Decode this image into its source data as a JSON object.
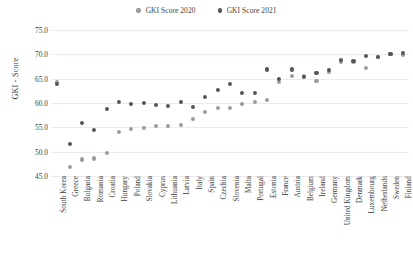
{
  "chart_data": {
    "type": "scatter",
    "title": "",
    "xlabel": "",
    "ylabel": "GKI - Score",
    "ylim": [
      45.0,
      75.0
    ],
    "yticks": [
      "45.0",
      "50.0",
      "55.0",
      "60.0",
      "65.0",
      "70.0",
      "75.0"
    ],
    "grid": true,
    "legend_position": "top-center",
    "categories": [
      "South Korea",
      "Greece",
      "Bulgaria",
      "Romania",
      "Croatia",
      "Hungary",
      "Poland",
      "Slovakia",
      "Cyprus",
      "Lithuania",
      "Latvia",
      "Italy",
      "Spain",
      "Czechia",
      "Slovenia",
      "Malta",
      "Portugal",
      "Estonia",
      "France",
      "Austria",
      "Belgium",
      "Ireland",
      "Germany",
      "United Kingdom",
      "Denmark",
      "Luxembourg",
      "Netherlands",
      "Sweden",
      "Finland"
    ],
    "series": [
      {
        "name": "GKI Score 2020",
        "color": "#9b9b9b",
        "values": [
          64.4,
          46.9,
          48.4,
          48.6,
          49.7,
          54.1,
          54.6,
          54.9,
          55.2,
          55.3,
          55.4,
          56.8,
          58.2,
          58.9,
          58.9,
          59.8,
          60.3,
          60.6,
          64.3,
          65.6,
          65.5,
          64.5,
          66.4,
          68.4,
          68.4,
          67.2,
          69.5,
          70.0,
          69.8
        ]
      },
      {
        "name": "GKI Score 2021",
        "color": "#555555",
        "values": [
          64.0,
          51.6,
          55.9,
          54.5,
          58.7,
          60.3,
          59.8,
          60.0,
          59.6,
          59.4,
          60.3,
          59.1,
          61.2,
          62.6,
          63.9,
          62.1,
          62.0,
          66.9,
          64.9,
          66.9,
          65.4,
          66.2,
          66.8,
          68.8,
          68.6,
          69.6,
          69.4,
          70.1,
          70.3
        ]
      }
    ]
  },
  "legend": {
    "entries": [
      {
        "label": "GKI Score 2020"
      },
      {
        "label": "GKI Score 2021"
      }
    ]
  }
}
